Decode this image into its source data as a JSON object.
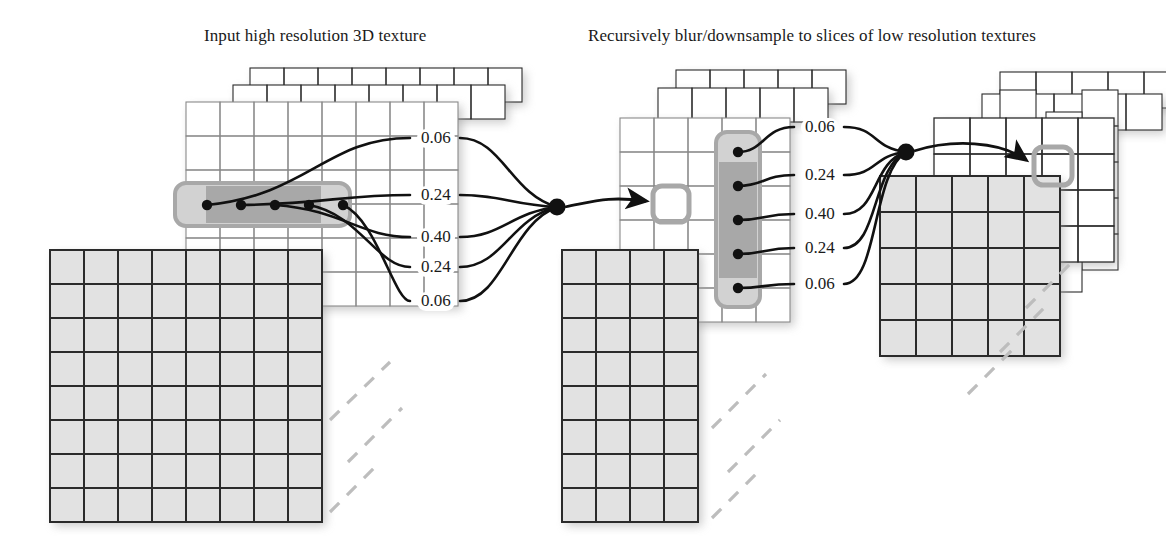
{
  "figure": {
    "title_left": "Input high resolution 3D texture",
    "title_right": "Recursively blur/downsample to slices of low resolution textures"
  },
  "colors": {
    "grid_stroke": "#2b2b2b",
    "grid_stroke_light": "#8a8a8a",
    "cell_white": "#ffffff",
    "cell_grey": "#e2e2e2",
    "highlight_fill": "#d2d2d2",
    "highlight_core": "#9a9a9a",
    "highlight_border": "#a8a8a8",
    "edge_color": "#111111",
    "node_color": "#111111",
    "dash_color": "#bdbdbd",
    "shadow_color": "#9e9e9e",
    "label_bg": "#ffffff",
    "text_color": "#1a1a1a"
  },
  "kernel": {
    "name": "gaussian-1d-5tap",
    "left_weights": [
      "0.06",
      "0.24",
      "0.40",
      "0.24",
      "0.06"
    ],
    "right_weights": [
      "0.06",
      "0.24",
      "0.40",
      "0.24",
      "0.06"
    ]
  },
  "stacks": {
    "high_res": {
      "label": "high-resolution-texture-stack",
      "slices": 3,
      "front_cols": 8,
      "front_rows": 8,
      "top_cols": 8,
      "top_rows": 6,
      "highlight_orientation": "horizontal",
      "tap_count": 5
    },
    "mid_res": {
      "label": "mid-resolution-texture-stack",
      "slices": 3,
      "front_cols": 4,
      "front_rows": 8,
      "top_cols": 4,
      "top_rows": 6,
      "highlight_orientation": "vertical",
      "tap_count": 5
    },
    "low_res": {
      "label": "low-resolution-texture-stack",
      "slices": 3,
      "front_cols": 4,
      "front_rows": 4,
      "top_cols": 4,
      "top_rows": 4,
      "highlight_orientation": "none",
      "tap_count": 0
    }
  },
  "targets": {
    "mid_target_label": "mid-resolution-target-texel",
    "low_target_label": "low-resolution-target-texel"
  },
  "weight_label_positions": {
    "left": [
      {
        "value": "0.06",
        "x": 417,
        "y": 129
      },
      {
        "value": "0.24",
        "x": 417,
        "y": 186
      },
      {
        "value": "0.40",
        "x": 417,
        "y": 228
      },
      {
        "value": "0.24",
        "x": 417,
        "y": 258
      },
      {
        "value": "0.06",
        "x": 417,
        "y": 292
      }
    ],
    "right": [
      {
        "value": "0.06",
        "x": 801,
        "y": 118
      },
      {
        "value": "0.24",
        "x": 801,
        "y": 166
      },
      {
        "value": "0.40",
        "x": 801,
        "y": 205
      },
      {
        "value": "0.24",
        "x": 801,
        "y": 239
      },
      {
        "value": "0.06",
        "x": 801,
        "y": 275
      }
    ]
  }
}
